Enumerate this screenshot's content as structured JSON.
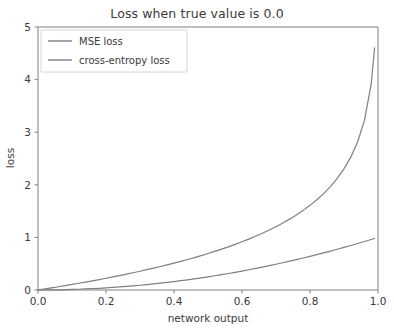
{
  "chart_data": {
    "type": "line",
    "title": "Loss when true value is 0.0",
    "xlabel": "network output",
    "ylabel": "loss",
    "xlim": [
      0.0,
      1.0
    ],
    "ylim": [
      0,
      5
    ],
    "grid": false,
    "legend_position": "upper left",
    "xticks": [
      "0.0",
      "0.2",
      "0.4",
      "0.6",
      "0.8",
      "1.0"
    ],
    "xtick_values": [
      0.0,
      0.2,
      0.4,
      0.6,
      0.8,
      1.0
    ],
    "yticks": [
      "0",
      "1",
      "2",
      "3",
      "4",
      "5"
    ],
    "ytick_values": [
      0,
      1,
      2,
      3,
      4,
      5
    ],
    "x": [
      0.0,
      0.02,
      0.04,
      0.06,
      0.08,
      0.1,
      0.12,
      0.14,
      0.16,
      0.18,
      0.2,
      0.22,
      0.24,
      0.26,
      0.28,
      0.3,
      0.32,
      0.34,
      0.36,
      0.38,
      0.4,
      0.42,
      0.44,
      0.46,
      0.48,
      0.5,
      0.52,
      0.54,
      0.56,
      0.58,
      0.6,
      0.62,
      0.64,
      0.66,
      0.68,
      0.7,
      0.72,
      0.74,
      0.76,
      0.78,
      0.8,
      0.82,
      0.84,
      0.86,
      0.88,
      0.9,
      0.92,
      0.94,
      0.96,
      0.98,
      0.99
    ],
    "series": [
      {
        "name": "MSE loss",
        "color": "#7f7f7f",
        "formula": "y = x^2",
        "values": [
          0.0,
          0.0004,
          0.0016,
          0.0036,
          0.0064,
          0.01,
          0.0144,
          0.0196,
          0.0256,
          0.0324,
          0.04,
          0.0484,
          0.0576,
          0.0676,
          0.0784,
          0.09,
          0.1024,
          0.1156,
          0.1296,
          0.1444,
          0.16,
          0.1764,
          0.1936,
          0.2116,
          0.2304,
          0.25,
          0.2704,
          0.2916,
          0.3136,
          0.3364,
          0.36,
          0.3844,
          0.4096,
          0.4356,
          0.4624,
          0.49,
          0.5184,
          0.5476,
          0.5776,
          0.6084,
          0.64,
          0.6724,
          0.7056,
          0.7396,
          0.7744,
          0.81,
          0.8464,
          0.8836,
          0.9216,
          0.9604,
          0.9801
        ]
      },
      {
        "name": "cross-entropy loss",
        "color": "#7f7f7f",
        "formula": "y = -ln(1 - x)",
        "values": [
          0.0,
          0.0202,
          0.0408,
          0.0619,
          0.0834,
          0.1054,
          0.1278,
          0.1508,
          0.1744,
          0.1985,
          0.2231,
          0.2485,
          0.2744,
          0.3011,
          0.3285,
          0.3567,
          0.3857,
          0.4155,
          0.4463,
          0.478,
          0.5108,
          0.5447,
          0.5798,
          0.6162,
          0.6539,
          0.6931,
          0.734,
          0.7765,
          0.821,
          0.8675,
          0.9163,
          0.9676,
          1.0217,
          1.0788,
          1.1394,
          1.204,
          1.273,
          1.3471,
          1.4271,
          1.5141,
          1.6094,
          1.7148,
          1.8326,
          1.9661,
          2.1203,
          2.3026,
          2.5257,
          2.8134,
          3.2189,
          3.912,
          4.6052
        ]
      }
    ]
  },
  "axes": {
    "spine_color": "#808080"
  }
}
